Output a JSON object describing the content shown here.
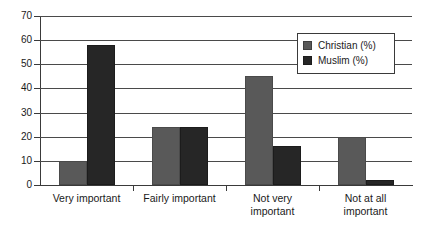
{
  "chart_data": {
    "type": "bar",
    "title": "",
    "subtitle": "",
    "xlabel": "",
    "ylabel": "",
    "ylim": [
      0,
      70
    ],
    "ytick_step": 10,
    "yticks": [
      0,
      10,
      20,
      30,
      40,
      50,
      60,
      70
    ],
    "ytick_labels": [
      "0",
      "10",
      "20",
      "30",
      "40",
      "50",
      "60",
      "70"
    ],
    "categories": [
      "Very important",
      "Fairly important",
      "Not very important",
      "Not at all important"
    ],
    "category_lines": [
      [
        "Very important"
      ],
      [
        "Fairly important"
      ],
      [
        "Not very",
        "important"
      ],
      [
        "Not at all",
        "important"
      ]
    ],
    "series": [
      {
        "name": "Christian (%)",
        "color": "#595959",
        "values": [
          10,
          24,
          45,
          20
        ]
      },
      {
        "name": "Muslim (%)",
        "color": "#262626",
        "values": [
          58,
          24,
          16,
          2
        ]
      }
    ],
    "grid": true,
    "grid_axis": "y",
    "legend": true,
    "legend_position": "top-right",
    "bar_orientation": "vertical",
    "background_color": "#ffffff",
    "axis_color": "#3a3a3a",
    "gridline_color": "#4a4a4a"
  },
  "legend": {
    "entries": [
      {
        "label": "Christian (%)"
      },
      {
        "label": "Muslim (%)"
      }
    ]
  }
}
